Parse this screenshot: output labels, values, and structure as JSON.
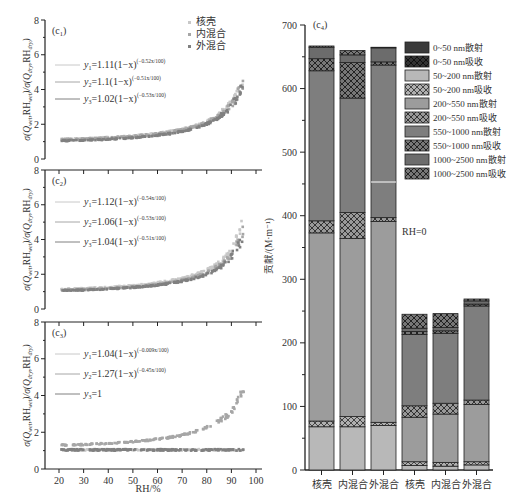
{
  "chart_data": [
    {
      "id": "c1",
      "type": "scatter",
      "panel_label": "(c1)",
      "xlabel": "RH/%",
      "ylabel": "σ(Q_wet,RH_wet)/σ(Q_dry,RH_dry)",
      "xlim": [
        15,
        100
      ],
      "ylim": [
        0,
        8
      ],
      "yticks": [
        0,
        2,
        4,
        6,
        8
      ],
      "legend": [
        "核壳",
        "内混合",
        "外混合"
      ],
      "fits": [
        {
          "label": "y1=1.11(1−x)^(−0.52x/100)",
          "a": 1.11,
          "b": 0.52
        },
        {
          "label": "y2=1.1(1−x)^(−0.51x/100)",
          "a": 1.1,
          "b": 0.51
        },
        {
          "label": "y3=1.02(1−x)^(−0.53x/100)",
          "a": 1.02,
          "b": 0.53
        }
      ],
      "scatter_range": {
        "x": [
          21,
          95
        ],
        "y_start": 1.0,
        "y_end_max": 6.0
      }
    },
    {
      "id": "c2",
      "type": "scatter",
      "panel_label": "(c2)",
      "xlabel": "RH/%",
      "ylim": [
        0,
        8
      ],
      "yticks": [
        0,
        2,
        4,
        6,
        8
      ],
      "fits": [
        {
          "label": "y1=1.12(1−x)^(−0.54x/100)",
          "a": 1.12,
          "b": 0.54
        },
        {
          "label": "y2=1.06(1−x)^(−0.53x/100)",
          "a": 1.06,
          "b": 0.53
        },
        {
          "label": "y3=1.04(1−x)^(−0.51x/100)",
          "a": 1.04,
          "b": 0.51
        }
      ],
      "scatter_range": {
        "x": [
          21,
          95
        ],
        "y_start": 1.0,
        "y_end_max": 6.7
      }
    },
    {
      "id": "c3",
      "type": "scatter",
      "panel_label": "(c3)",
      "xlabel": "RH/%",
      "xticks": [
        20,
        30,
        40,
        50,
        60,
        70,
        80,
        90,
        100
      ],
      "ylim": [
        0,
        8
      ],
      "yticks": [
        0,
        2,
        4,
        6,
        8
      ],
      "fits": [
        {
          "label": "y1=1.04(1−x)^(−0.009x/100)",
          "a": 1.04,
          "b": 0.009
        },
        {
          "label": "y2=1.27(1−x)^(−0.45x/100)",
          "a": 1.27,
          "b": 0.45
        },
        {
          "label": "y3=1",
          "a": 1,
          "b": 0
        }
      ],
      "scatter_range": {
        "x": [
          21,
          95
        ],
        "y_start": 1.0,
        "y_end_max": 4.2
      }
    },
    {
      "id": "c4",
      "type": "bar",
      "stacked": true,
      "panel_label": "(c4)",
      "ylabel": "贡献/(M·m⁻¹)",
      "ylim": [
        0,
        700
      ],
      "yticks": [
        0,
        100,
        200,
        300,
        400,
        500,
        600,
        700
      ],
      "annotation": "RH=0",
      "categories": [
        "核壳",
        "内混合",
        "外混合",
        "核壳",
        "内混合",
        "外混合"
      ],
      "series": [
        {
          "name": "0~50 nm散射",
          "values": [
            0,
            0,
            0,
            0,
            0,
            0
          ]
        },
        {
          "name": "0~50 nm吸收",
          "values": [
            0,
            0,
            0,
            0,
            0,
            0
          ]
        },
        {
          "name": "50~200 nm散射",
          "values": [
            68,
            68,
            70,
            7,
            6,
            8
          ]
        },
        {
          "name": "50~200 nm吸收",
          "values": [
            9,
            16,
            5,
            6,
            6,
            5
          ]
        },
        {
          "name": "200~550 nm散射",
          "values": [
            296,
            280,
            316,
            70,
            76,
            90
          ]
        },
        {
          "name": "200~550 nm吸收",
          "values": [
            19,
            41,
            6,
            18,
            17,
            7
          ]
        },
        {
          "name": "550~1000 nm散射",
          "values": [
            236,
            180,
            240,
            112,
            110,
            148
          ]
        },
        {
          "name": "550~1000 nm吸收",
          "values": [
            19,
            56,
            5,
            5,
            4,
            3
          ]
        },
        {
          "name": "1000~2500 nm散射",
          "values": [
            18,
            12,
            22,
            5,
            5,
            5
          ]
        },
        {
          "name": "1000~2500 nm吸收",
          "values": [
            2,
            7,
            1,
            22,
            22,
            3
          ]
        }
      ],
      "totals": [
        667,
        665,
        665,
        245,
        252,
        269
      ]
    }
  ],
  "left": {
    "panels": [
      {
        "label_main": "(c",
        "label_sub": "1",
        "label_end": ")"
      },
      {
        "label_main": "(c",
        "label_sub": "2",
        "label_end": ")"
      },
      {
        "label_main": "(c",
        "label_sub": "3",
        "label_end": ")"
      }
    ],
    "legend": [
      "核壳",
      "内混合",
      "外混合"
    ],
    "xlabel": "RH/%",
    "xticks": [
      "20",
      "30",
      "40",
      "50",
      "60",
      "70",
      "80",
      "90",
      "100"
    ],
    "yticks": [
      "0",
      "2",
      "4",
      "6",
      "8"
    ],
    "fits": [
      [
        {
          "pre": "y",
          "sub": "1",
          "eq": "=1.11(1−x)",
          "exp": "(−0.52x/100)"
        },
        {
          "pre": "y",
          "sub": "2",
          "eq": "=1.1(1−x)",
          "exp": "(−0.51x/100)"
        },
        {
          "pre": "y",
          "sub": "3",
          "eq": "=1.02(1−x)",
          "exp": "(−0.53x/100)"
        }
      ],
      [
        {
          "pre": "y",
          "sub": "1",
          "eq": "=1.12(1−x)",
          "exp": "(−0.54x/100)"
        },
        {
          "pre": "y",
          "sub": "2",
          "eq": "=1.06(1−x)",
          "exp": "(−0.53x/100)"
        },
        {
          "pre": "y",
          "sub": "3",
          "eq": "=1.04(1−x)",
          "exp": "(−0.51x/100)"
        }
      ],
      [
        {
          "pre": "y",
          "sub": "1",
          "eq": "=1.04(1−x)",
          "exp": "(−0.009x/100)"
        },
        {
          "pre": "y",
          "sub": "2",
          "eq": "=1.27(1−x)",
          "exp": "(−0.45x/100)"
        },
        {
          "pre": "y",
          "sub": "3",
          "eq": "=1",
          "exp": ""
        }
      ]
    ]
  },
  "right": {
    "panel_label": "(c",
    "panel_sub": "4",
    "panel_end": ")",
    "ylabel": "贡献/(M·m⁻¹)",
    "annotation": "RH=0",
    "yticks": [
      "0",
      "100",
      "200",
      "300",
      "400",
      "500",
      "600",
      "700"
    ],
    "categories": [
      "核壳",
      "内混合",
      "外混合",
      "核壳",
      "内混合",
      "外混合"
    ],
    "legend": [
      "0~50 nm散射",
      "0~50 nm吸收",
      "50~200 nm散射",
      "50~200 nm吸收",
      "200~550 nm散射",
      "200~550 nm吸收",
      "550~1000 nm散射",
      "550~1000 nm吸收",
      "1000~2500 nm散射",
      "1000~2500 nm吸收"
    ]
  },
  "colors": {
    "scatter_core_shell": "#c8c8c8",
    "scatter_internal": "#a6a6a6",
    "scatter_external": "#808080",
    "bar_0_50_sca": "#3a3a3a",
    "bar_0_50_abs": "#1e1e1e",
    "bar_50_200_sca": "#b8b8b8",
    "bar_50_200_abs": "#9a9a9a",
    "bar_200_550_sca": "#9c9c9c",
    "bar_200_550_abs": "#8a8a8a",
    "bar_550_1000_sca": "#7e7e7e",
    "bar_550_1000_abs": "#6a6a6a",
    "bar_1000_2500_sca": "#6c6c6c",
    "bar_1000_2500_abs": "#555555"
  }
}
